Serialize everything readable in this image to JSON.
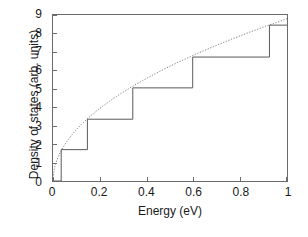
{
  "chart_data": {
    "type": "line",
    "title": "",
    "subtitle": "",
    "xlabel": "Energy (eV)",
    "ylabel": "Density of states (arb. units)",
    "xlim": [
      0,
      1
    ],
    "ylim": [
      0,
      9
    ],
    "xticks": [
      0,
      0.2,
      0.4,
      0.6,
      0.8,
      1
    ],
    "xtick_labels": [
      "0",
      "0.2",
      "0.4",
      "0.6",
      "0.8",
      "1"
    ],
    "yticks": [
      0,
      1,
      2,
      3,
      4,
      5,
      6,
      7,
      8,
      9
    ],
    "ytick_labels": [
      "0",
      "1",
      "2",
      "3",
      "4",
      "5",
      "6",
      "7",
      "8",
      "9"
    ],
    "grid": false,
    "legend": "none",
    "line_color": "#5a5a5a",
    "frame_color": "#6b6b6b",
    "background": "#ffffff",
    "series": [
      {
        "name": "bulk 3D density of states",
        "style": "dotted",
        "color": "#7a7a7a",
        "description": "smooth square-root curve y = 8.8 * sqrt(x)",
        "x": [
          0.0,
          0.01,
          0.02,
          0.04,
          0.06,
          0.08,
          0.1,
          0.14,
          0.18,
          0.22,
          0.26,
          0.3,
          0.35,
          0.4,
          0.45,
          0.5,
          0.55,
          0.6,
          0.65,
          0.7,
          0.75,
          0.8,
          0.85,
          0.9,
          0.95,
          1.0
        ],
        "y": [
          0.0,
          0.88,
          1.24,
          1.76,
          2.16,
          2.49,
          2.78,
          3.29,
          3.73,
          4.13,
          4.49,
          4.82,
          5.21,
          5.57,
          5.9,
          6.22,
          6.53,
          6.82,
          7.09,
          7.36,
          7.62,
          7.87,
          8.11,
          8.35,
          8.58,
          8.8
        ]
      },
      {
        "name": "quantum-well staircase density of states",
        "style": "solid",
        "color": "#5a5a5a",
        "description": "step function; each riser at a subband edge energy",
        "step_edges": [
          0.035,
          0.147,
          0.341,
          0.597,
          0.925
        ],
        "step_levels": [
          0.0,
          1.7,
          3.35,
          5.05,
          6.72,
          8.45
        ],
        "x": [
          0.0,
          0.035,
          0.035,
          0.147,
          0.147,
          0.341,
          0.341,
          0.597,
          0.597,
          0.925,
          0.925,
          1.0
        ],
        "y": [
          0.0,
          0.0,
          1.7,
          1.7,
          3.35,
          3.35,
          5.05,
          5.05,
          6.72,
          6.72,
          8.45,
          8.45
        ]
      }
    ]
  }
}
